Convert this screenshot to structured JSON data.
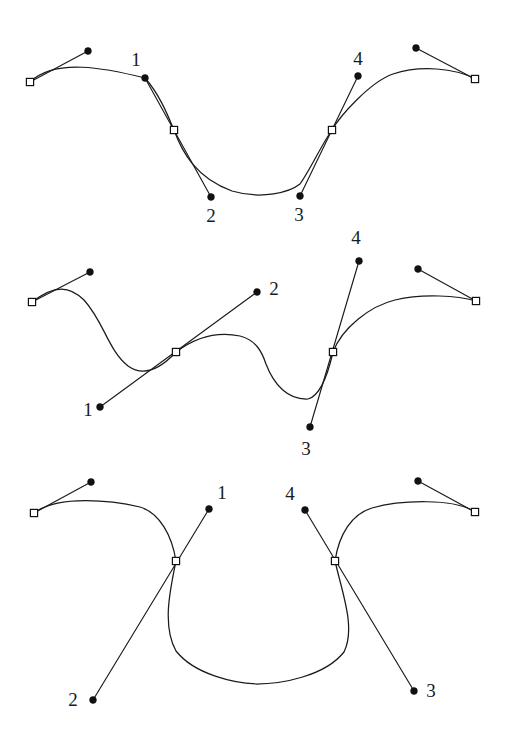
{
  "figure": {
    "background_color": "#ffffff",
    "stroke_color": "#1a1a1a",
    "anchor_fill": "#ffffff",
    "control_dot_color": "#111111",
    "width": 508,
    "height": 751,
    "panel_count": 3
  },
  "panels": [
    {
      "id": "panel-1",
      "name": "smooth-symmetric-tangents",
      "anchors": [
        {
          "name": "anchor-left-end",
          "x": 30,
          "y": 82
        },
        {
          "name": "anchor-mid-left",
          "x": 174,
          "y": 130
        },
        {
          "name": "anchor-mid-right",
          "x": 332,
          "y": 130
        },
        {
          "name": "anchor-right-end",
          "x": 475,
          "y": 79
        }
      ],
      "control_points": [
        {
          "name": "ctrl-outer-left",
          "x": 88,
          "y": 51,
          "label": ""
        },
        {
          "name": "ctrl-1",
          "x": 145,
          "y": 78,
          "label": "1"
        },
        {
          "name": "ctrl-2",
          "x": 211,
          "y": 197,
          "label": "2"
        },
        {
          "name": "ctrl-3",
          "x": 300,
          "y": 196,
          "label": "3"
        },
        {
          "name": "ctrl-4",
          "x": 358,
          "y": 76,
          "label": "4"
        },
        {
          "name": "ctrl-outer-right",
          "x": 416,
          "y": 48,
          "label": ""
        }
      ],
      "labels": [
        {
          "text": "1",
          "x": 136,
          "y": 62
        },
        {
          "text": "2",
          "x": 211,
          "y": 218
        },
        {
          "text": "3",
          "x": 299,
          "y": 217
        },
        {
          "text": "4",
          "x": 358,
          "y": 61
        }
      ],
      "curve_path": "M 30 82 C 55 58 105 68 145 78 C 160 95 168 116 174 130 C 182 152 196 178 232 191 C 262 200 290 192 300 184 C 310 170 322 144 332 130 C 340 116 370 82 393 74 C 420 65 455 68 475 79",
      "handles": [
        {
          "name": "handle-left-end",
          "from": [
            30,
            82
          ],
          "to": [
            88,
            51
          ]
        },
        {
          "name": "handle-mid-left",
          "from": [
            145,
            78
          ],
          "to": [
            211,
            197
          ]
        },
        {
          "name": "handle-mid-right",
          "from": [
            300,
            196
          ],
          "to": [
            358,
            76
          ]
        },
        {
          "name": "handle-right-end",
          "from": [
            475,
            79
          ],
          "to": [
            416,
            48
          ]
        }
      ]
    },
    {
      "id": "panel-2",
      "name": "asymmetric-tangents",
      "anchors": [
        {
          "name": "anchor-left-end",
          "x": 32,
          "y": 302
        },
        {
          "name": "anchor-mid-left",
          "x": 176,
          "y": 352
        },
        {
          "name": "anchor-mid-right",
          "x": 333,
          "y": 352
        },
        {
          "name": "anchor-right-end",
          "x": 476,
          "y": 301
        }
      ],
      "control_points": [
        {
          "name": "ctrl-outer-left",
          "x": 90,
          "y": 272,
          "label": ""
        },
        {
          "name": "ctrl-1",
          "x": 100,
          "y": 407,
          "label": "1"
        },
        {
          "name": "ctrl-2",
          "x": 257,
          "y": 292,
          "label": "2"
        },
        {
          "name": "ctrl-3",
          "x": 310,
          "y": 427,
          "label": "3"
        },
        {
          "name": "ctrl-4",
          "x": 359,
          "y": 261,
          "label": "4"
        },
        {
          "name": "ctrl-outer-right",
          "x": 418,
          "y": 269,
          "label": ""
        }
      ],
      "labels": [
        {
          "text": "1",
          "x": 88,
          "y": 412
        },
        {
          "text": "2",
          "x": 274,
          "y": 291
        },
        {
          "text": "3",
          "x": 306,
          "y": 451
        },
        {
          "text": "4",
          "x": 356,
          "y": 240
        }
      ],
      "curve_path": "M 32 302 C 55 284 70 286 84 300 C 104 322 108 350 128 366 C 145 378 163 366 176 352 C 196 337 216 331 240 336 C 256 340 262 352 266 364 C 274 385 288 400 308 399 C 320 396 328 374 333 352 C 342 328 370 306 395 300 C 424 293 458 296 476 301",
      "handles": [
        {
          "name": "handle-left-end",
          "from": [
            32,
            302
          ],
          "to": [
            90,
            272
          ]
        },
        {
          "name": "handle-mid-left",
          "from": [
            100,
            407
          ],
          "to": [
            257,
            292
          ]
        },
        {
          "name": "handle-mid-right",
          "from": [
            310,
            427
          ],
          "to": [
            359,
            261
          ]
        },
        {
          "name": "handle-right-end",
          "from": [
            476,
            301
          ],
          "to": [
            418,
            269
          ]
        }
      ]
    },
    {
      "id": "panel-3",
      "name": "crossed-tangents-loop",
      "anchors": [
        {
          "name": "anchor-left-end",
          "x": 34,
          "y": 513
        },
        {
          "name": "anchor-mid-left",
          "x": 176,
          "y": 561
        },
        {
          "name": "anchor-mid-right",
          "x": 335,
          "y": 561
        },
        {
          "name": "anchor-right-end",
          "x": 475,
          "y": 512
        }
      ],
      "control_points": [
        {
          "name": "ctrl-outer-left",
          "x": 91,
          "y": 482,
          "label": ""
        },
        {
          "name": "ctrl-1",
          "x": 209,
          "y": 509,
          "label": "1"
        },
        {
          "name": "ctrl-2",
          "x": 93,
          "y": 700,
          "label": "2"
        },
        {
          "name": "ctrl-3",
          "x": 414,
          "y": 691,
          "label": "3"
        },
        {
          "name": "ctrl-4",
          "x": 305,
          "y": 510,
          "label": "4"
        },
        {
          "name": "ctrl-outer-right",
          "x": 418,
          "y": 481,
          "label": ""
        }
      ],
      "labels": [
        {
          "text": "1",
          "x": 222,
          "y": 495
        },
        {
          "text": "2",
          "x": 73,
          "y": 702
        },
        {
          "text": "3",
          "x": 431,
          "y": 693
        },
        {
          "text": "4",
          "x": 290,
          "y": 496
        }
      ],
      "curve_path": "M 34 513 C 58 495 110 500 140 507 C 160 513 172 536 176 561 C 170 590 162 626 176 651 C 195 675 235 683 256 684 C 282 684 325 676 344 652 C 356 628 342 592 335 561 C 339 534 352 514 372 508 C 400 500 455 498 475 512",
      "handles": [
        {
          "name": "handle-left-end",
          "from": [
            34,
            513
          ],
          "to": [
            91,
            482
          ]
        },
        {
          "name": "handle-mid-left",
          "from": [
            209,
            509
          ],
          "to": [
            93,
            700
          ]
        },
        {
          "name": "handle-mid-right",
          "from": [
            305,
            510
          ],
          "to": [
            414,
            691
          ]
        },
        {
          "name": "handle-right-end",
          "from": [
            475,
            512
          ],
          "to": [
            418,
            481
          ]
        }
      ]
    }
  ]
}
